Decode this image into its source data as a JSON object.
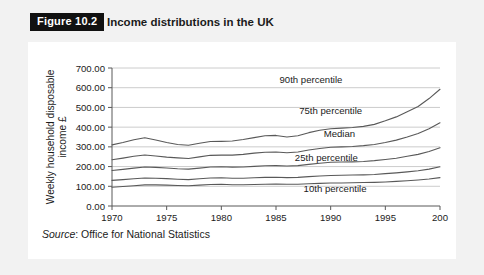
{
  "figure": {
    "badge": "Figure 10.2",
    "title": "Income distributions in the UK",
    "source_label": "Source",
    "source_text": ": Office for National Statistics"
  },
  "chart_data": {
    "type": "line",
    "title": "",
    "xlabel": "Year",
    "ylabel": "Weekly household disposable income £",
    "ylabel_line1": "Weekly household disposable",
    "ylabel_line2": "income £",
    "xlim": [
      1970,
      2000
    ],
    "ylim": [
      0,
      700
    ],
    "xticks": [
      1970,
      1975,
      1980,
      1985,
      1990,
      1995,
      2000
    ],
    "xtick_labels": [
      "1970",
      "1975",
      "1980",
      "1985",
      "1990",
      "1995",
      "200"
    ],
    "yticks": [
      0,
      100,
      200,
      300,
      400,
      500,
      600,
      700
    ],
    "ytick_labels": [
      "0.00",
      "100.00",
      "200.00",
      "300.00",
      "400.00",
      "500.00",
      "600.00",
      "700.00"
    ],
    "grid": "horizontal",
    "legend_position": "inline-annotations",
    "line_color": "#595959",
    "grid_color": "#cccccc",
    "axis_color": "#595959",
    "x": [
      1970,
      1971,
      1972,
      1973,
      1974,
      1975,
      1976,
      1977,
      1978,
      1979,
      1980,
      1981,
      1982,
      1983,
      1984,
      1985,
      1986,
      1987,
      1988,
      1989,
      1990,
      1991,
      1992,
      1993,
      1994,
      1995,
      1996,
      1997,
      1998,
      1999,
      2000
    ],
    "series": [
      {
        "name": "90th percentile",
        "label": "90th percentile",
        "values": [
          310,
          322,
          336,
          346,
          335,
          322,
          312,
          308,
          318,
          327,
          328,
          330,
          337,
          347,
          356,
          358,
          350,
          356,
          372,
          384,
          392,
          395,
          398,
          404,
          414,
          432,
          452,
          478,
          505,
          545,
          592
        ]
      },
      {
        "name": "75th percentile",
        "label": "75th percentile",
        "values": [
          235,
          243,
          252,
          259,
          254,
          248,
          244,
          241,
          249,
          257,
          258,
          258,
          262,
          268,
          273,
          274,
          270,
          274,
          284,
          292,
          298,
          300,
          302,
          306,
          312,
          322,
          334,
          350,
          368,
          392,
          422
        ]
      },
      {
        "name": "Median",
        "label": "Median",
        "values": [
          180,
          186,
          192,
          198,
          196,
          193,
          189,
          187,
          192,
          198,
          199,
          197,
          198,
          201,
          204,
          205,
          203,
          205,
          211,
          217,
          222,
          223,
          224,
          226,
          230,
          236,
          242,
          252,
          262,
          276,
          296
        ]
      },
      {
        "name": "25th percentile",
        "label": "25th percentile",
        "values": [
          130,
          134,
          138,
          142,
          141,
          139,
          136,
          134,
          138,
          142,
          143,
          141,
          141,
          143,
          145,
          146,
          144,
          145,
          149,
          152,
          155,
          156,
          157,
          158,
          160,
          164,
          168,
          173,
          179,
          187,
          199
        ]
      },
      {
        "name": "10th percentile",
        "label": "10th percentile",
        "values": [
          95,
          99,
          103,
          107,
          107,
          106,
          104,
          103,
          106,
          109,
          110,
          108,
          108,
          109,
          110,
          111,
          110,
          110,
          113,
          115,
          117,
          117,
          118,
          119,
          120,
          122,
          125,
          128,
          132,
          137,
          144
        ]
      }
    ],
    "annotations": [
      {
        "text": "90th percentile",
        "x": 1988.2,
        "y": 625
      },
      {
        "text": "75th percentile",
        "x": 1990.0,
        "y": 467
      },
      {
        "text": "Median",
        "x": 1990.8,
        "y": 352
      },
      {
        "text": "25th percentile",
        "x": 1989.6,
        "y": 228
      },
      {
        "text": "10th percentile",
        "x": 1990.4,
        "y": 73
      }
    ]
  }
}
